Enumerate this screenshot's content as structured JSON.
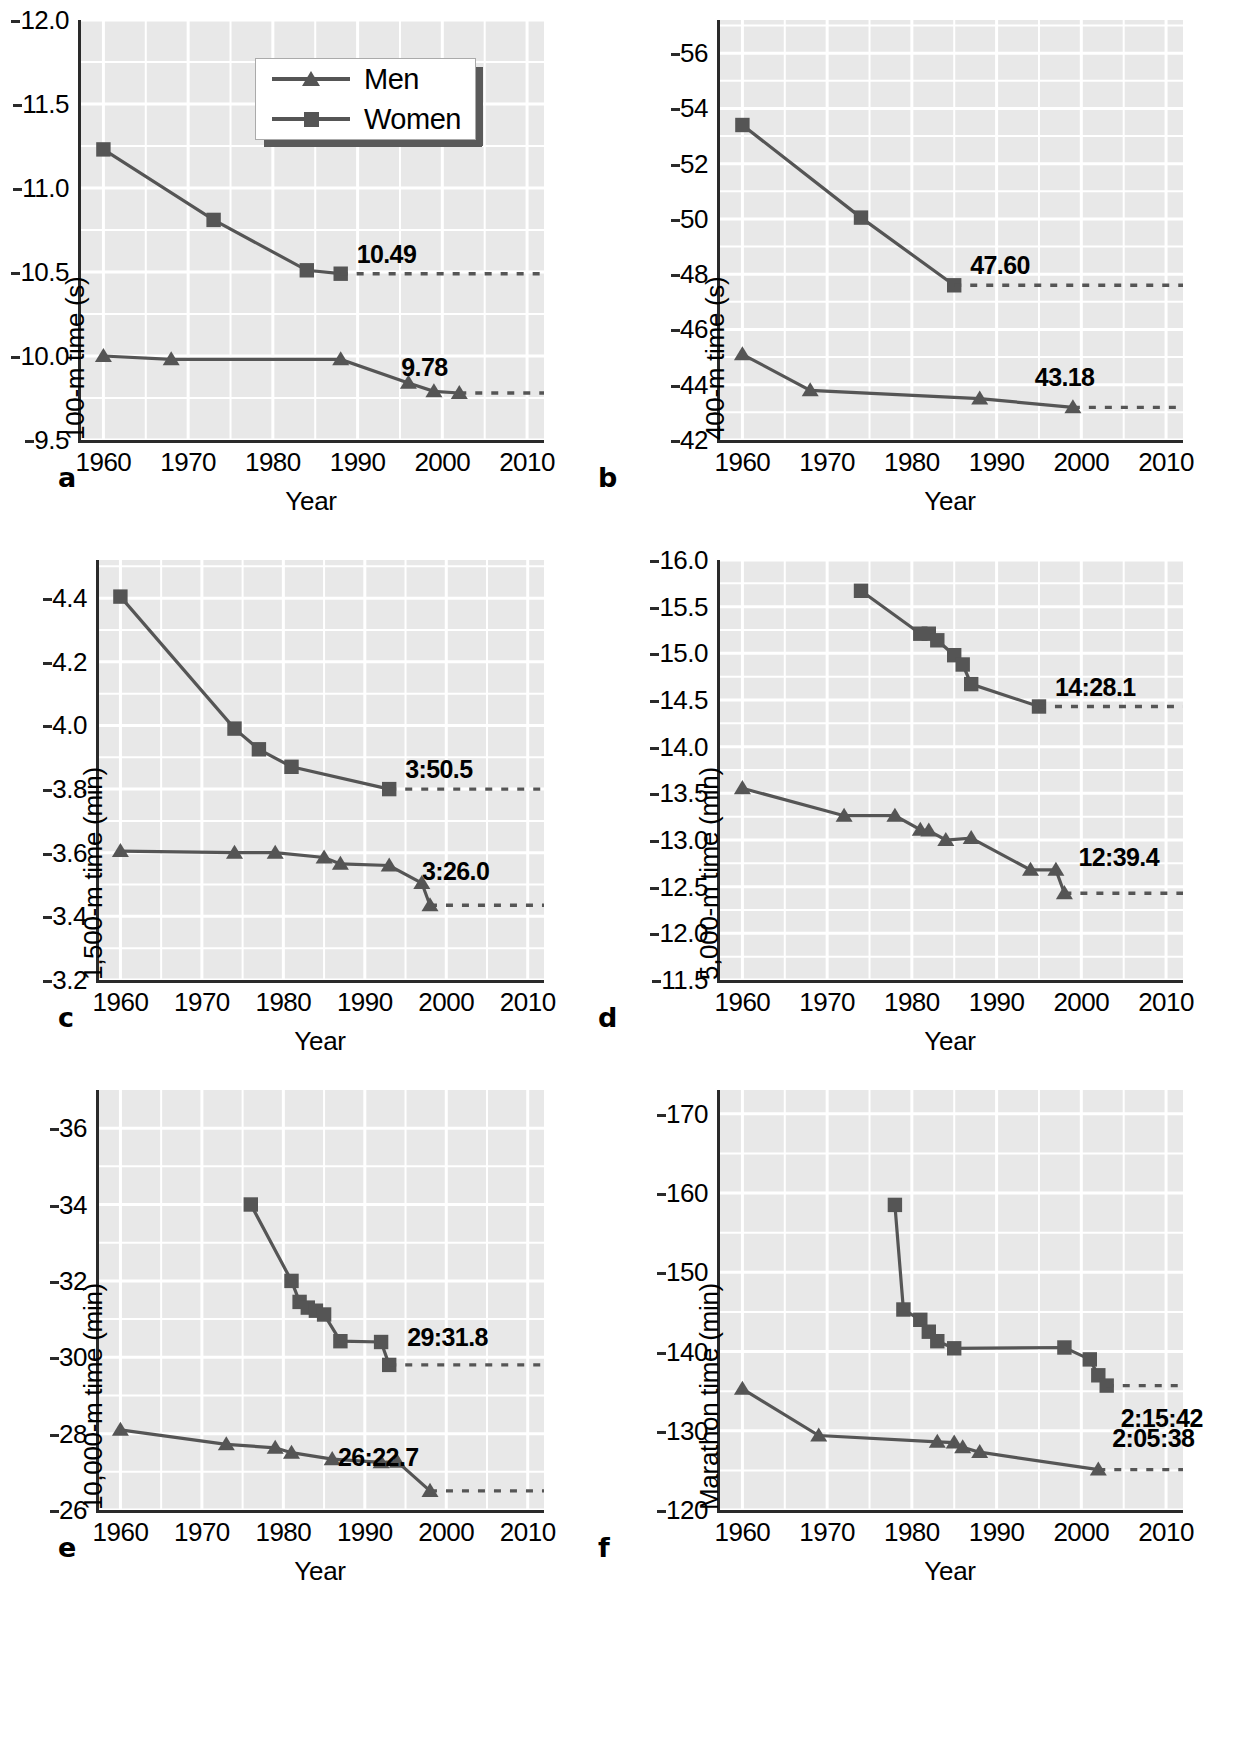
{
  "legend": {
    "entries": [
      {
        "label": "Men",
        "marker": "triangle"
      },
      {
        "label": "Women",
        "marker": "square"
      }
    ]
  },
  "common": {
    "xlabel": "Year",
    "xticks": [
      1960,
      1970,
      1980,
      1990,
      2000,
      2010
    ],
    "xlim": [
      1957,
      2012
    ]
  },
  "chart_data": [
    {
      "panel": "a",
      "type": "line",
      "title": "",
      "xlabel": "Year",
      "ylabel": "100-m time (s)",
      "xlim": [
        1957,
        2012
      ],
      "ylim": [
        9.5,
        12.0
      ],
      "yticks": [
        9.5,
        10.0,
        10.5,
        11.0,
        11.5,
        12.0
      ],
      "ytick_labels": [
        "9.5",
        "10.0",
        "10.5",
        "11.0",
        "11.5",
        "12.0"
      ],
      "grid": true,
      "legend_position": "top-right",
      "series": [
        {
          "name": "Men",
          "marker": "triangle",
          "x": [
            1960,
            1968,
            1988,
            1996,
            1999,
            2002
          ],
          "y": [
            10.0,
            9.98,
            9.98,
            9.84,
            9.79,
            9.78
          ],
          "annotation": "9.78",
          "annotation_value": 9.78
        },
        {
          "name": "Women",
          "marker": "square",
          "x": [
            1960,
            1973,
            1984,
            1988
          ],
          "y": [
            11.23,
            10.81,
            10.51,
            10.49
          ],
          "annotation": "10.49",
          "annotation_value": 10.49
        }
      ]
    },
    {
      "panel": "b",
      "type": "line",
      "title": "",
      "xlabel": "Year",
      "ylabel": "400-m time (s)",
      "xlim": [
        1957,
        2012
      ],
      "ylim": [
        42,
        57.2
      ],
      "yticks": [
        42,
        44,
        46,
        48,
        50,
        52,
        54,
        56
      ],
      "ytick_labels": [
        "42",
        "44",
        "46",
        "48",
        "50",
        "52",
        "54",
        "56"
      ],
      "grid": true,
      "legend_position": "none",
      "series": [
        {
          "name": "Men",
          "marker": "triangle",
          "x": [
            1960,
            1968,
            1988,
            1999
          ],
          "y": [
            45.1,
            43.8,
            43.5,
            43.18
          ],
          "annotation": "43.18",
          "annotation_value": 43.18
        },
        {
          "name": "Women",
          "marker": "square",
          "x": [
            1960,
            1974,
            1985
          ],
          "y": [
            53.4,
            50.05,
            47.6
          ],
          "annotation": "47.60",
          "annotation_value": 47.6
        }
      ]
    },
    {
      "panel": "c",
      "type": "line",
      "title": "",
      "xlabel": "Year",
      "ylabel": "1,500-m time (min)",
      "xlim": [
        1957,
        2012
      ],
      "ylim": [
        3.2,
        4.52
      ],
      "yticks": [
        3.2,
        3.4,
        3.6,
        3.8,
        4.0,
        4.2,
        4.4
      ],
      "ytick_labels": [
        "3.2",
        "3.4",
        "3.6",
        "3.8",
        "4.0",
        "4.2",
        "4.4"
      ],
      "grid": true,
      "legend_position": "none",
      "series": [
        {
          "name": "Men",
          "marker": "triangle",
          "x": [
            1960,
            1974,
            1979,
            1985,
            1987,
            1993,
            1997,
            1998
          ],
          "y": [
            3.605,
            3.6,
            3.6,
            3.585,
            3.565,
            3.56,
            3.505,
            3.435
          ],
          "annotation": "3:26.0",
          "annotation_value": 3.4333
        },
        {
          "name": "Women",
          "marker": "square",
          "x": [
            1960,
            1974,
            1977,
            1981,
            1993
          ],
          "y": [
            4.405,
            3.99,
            3.925,
            3.87,
            3.8
          ],
          "annotation": "3:50.5",
          "annotation_value": 3.8083
        }
      ]
    },
    {
      "panel": "d",
      "type": "line",
      "title": "",
      "xlabel": "Year",
      "ylabel": "5,000-m time (min)",
      "xlim": [
        1957,
        2012
      ],
      "ylim": [
        11.5,
        16.0
      ],
      "yticks": [
        11.5,
        12.0,
        12.5,
        13.0,
        13.5,
        14.0,
        14.5,
        15.0,
        15.5,
        16.0
      ],
      "ytick_labels": [
        "11.5",
        "12.0",
        "12.5",
        "13.0",
        "13.5",
        "14.0",
        "14.5",
        "15.0",
        "15.5",
        "16.0"
      ],
      "grid": true,
      "legend_position": "none",
      "series": [
        {
          "name": "Men",
          "marker": "triangle",
          "x": [
            1960,
            1972,
            1978,
            1981,
            1982,
            1984,
            1987,
            1994,
            1997,
            1998
          ],
          "y": [
            13.555,
            13.26,
            13.26,
            13.11,
            13.1,
            13.0,
            13.02,
            12.68,
            12.68,
            12.43
          ],
          "annotation": "12:39.4",
          "annotation_value": 12.657
        },
        {
          "name": "Women",
          "marker": "square",
          "x": [
            1974,
            1981,
            1982,
            1983,
            1985,
            1986,
            1987,
            1995
          ],
          "y": [
            15.67,
            15.21,
            15.21,
            15.14,
            14.98,
            14.88,
            14.67,
            14.43
          ],
          "annotation": "14:28.1",
          "annotation_value": 14.468
        }
      ]
    },
    {
      "panel": "e",
      "type": "line",
      "title": "",
      "xlabel": "Year",
      "ylabel": "10,000-m time (min)",
      "xlim": [
        1957,
        2012
      ],
      "ylim": [
        26,
        37
      ],
      "yticks": [
        26,
        28,
        30,
        32,
        34,
        36
      ],
      "ytick_labels": [
        "26",
        "28",
        "30",
        "32",
        "34",
        "36"
      ],
      "grid": true,
      "legend_position": "none",
      "series": [
        {
          "name": "Men",
          "marker": "triangle",
          "x": [
            1960,
            1973,
            1979,
            1981,
            1986,
            1992,
            1994,
            1998
          ],
          "y": [
            28.1,
            27.72,
            27.63,
            27.5,
            27.33,
            27.25,
            27.26,
            26.5
          ],
          "annotation": "26:22.7",
          "annotation_value": 26.378
        },
        {
          "name": "Women",
          "marker": "square",
          "x": [
            1976,
            1981,
            1982,
            1983,
            1984,
            1985,
            1987,
            1992,
            1993
          ],
          "y": [
            34.0,
            32.0,
            31.45,
            31.3,
            31.22,
            31.12,
            30.42,
            30.4,
            29.8
          ],
          "annotation": "29:31.8",
          "annotation_value": 29.53
        }
      ]
    },
    {
      "panel": "f",
      "type": "line",
      "title": "",
      "xlabel": "Year",
      "ylabel": "Marathon time (min)",
      "xlim": [
        1957,
        2012
      ],
      "ylim": [
        120,
        173
      ],
      "yticks": [
        120,
        130,
        140,
        150,
        160,
        170
      ],
      "ytick_labels": [
        "120",
        "130",
        "140",
        "150",
        "160",
        "170"
      ],
      "grid": true,
      "legend_position": "none",
      "series": [
        {
          "name": "Men",
          "marker": "triangle",
          "x": [
            1960,
            1969,
            1983,
            1985,
            1986,
            1988,
            2002
          ],
          "y": [
            135.3,
            129.4,
            128.6,
            128.5,
            127.9,
            127.3,
            125.1
          ],
          "annotation": "2:05:38",
          "annotation_value": 125.63
        },
        {
          "name": "Women",
          "marker": "square",
          "x": [
            1978,
            1979,
            1981,
            1982,
            1983,
            1985,
            1998,
            2001,
            2002,
            2003
          ],
          "y": [
            158.5,
            145.3,
            144.0,
            142.5,
            141.3,
            140.4,
            140.5,
            139.0,
            137.0,
            135.7
          ],
          "annotation": "2:15:42",
          "annotation_value": 135.7
        }
      ]
    }
  ]
}
